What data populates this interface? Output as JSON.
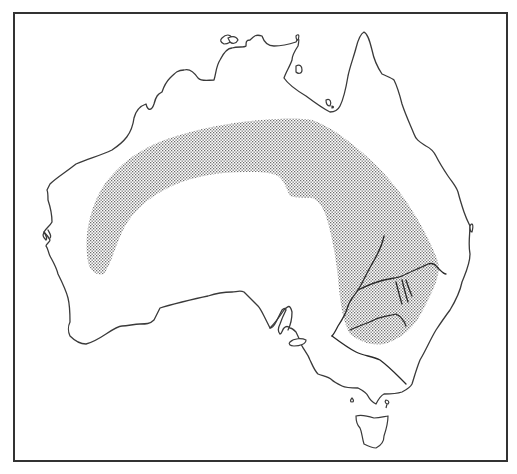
{
  "map": {
    "subject": "Australia",
    "frame": {
      "x": 13,
      "y": 12,
      "width": 493,
      "height": 448,
      "border_color": "#333333"
    },
    "colors": {
      "background": "#ffffff",
      "coastline": "#3a3a3a",
      "river": "#2a2a2a",
      "range_stipple": "#8a8a8a"
    },
    "layers": [
      {
        "name": "mainland-coastline",
        "type": "outline"
      },
      {
        "name": "tasmania",
        "type": "outline"
      },
      {
        "name": "islands",
        "type": "outline",
        "count": 8
      },
      {
        "name": "distribution-range",
        "type": "stippled-area",
        "description": "arc-shaped band across central/northern interior extending to south-east"
      },
      {
        "name": "rivers",
        "type": "lines",
        "description": "Murray-Darling river system in south-east"
      }
    ],
    "legend": null,
    "labels": []
  }
}
